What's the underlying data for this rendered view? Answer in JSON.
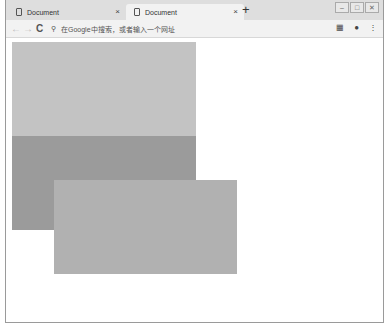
{
  "browser": {
    "tabs": [
      {
        "title": "Document",
        "close": "×",
        "active": false
      },
      {
        "title": "Document",
        "close": "×",
        "active": true
      }
    ],
    "new_tab": "+",
    "window_controls": {
      "minimize": "–",
      "maximize": "□",
      "close": "✕"
    },
    "toolbar": {
      "back": "←",
      "forward": "→",
      "reload": "C",
      "omnibox_placeholder": "在Google中搜索，或者输入一个网址",
      "search_glyph": "⚲",
      "extension_glyph": "▦",
      "account_glyph": "●",
      "menu_glyph": "⋮"
    }
  },
  "page": {
    "boxes": [
      {
        "name": "box-1",
        "color": "#c3c3c3"
      },
      {
        "name": "box-2",
        "color": "#9b9b9b"
      },
      {
        "name": "box-3",
        "color": "#b1b1b1"
      }
    ]
  }
}
